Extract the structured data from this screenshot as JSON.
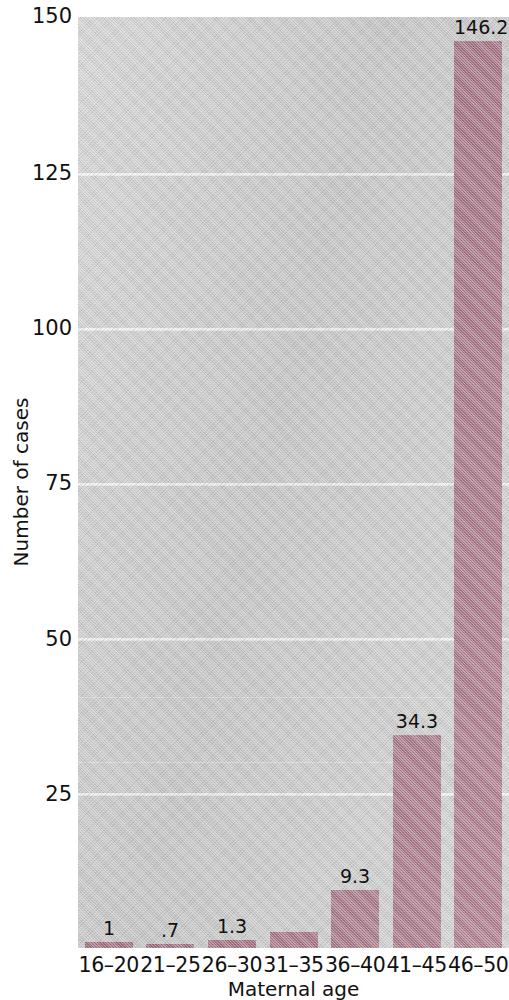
{
  "chart_data": {
    "type": "bar",
    "title": "",
    "subtitle": "",
    "xlabel": "Maternal age",
    "ylabel": "Number of cases",
    "categories": [
      "16–20",
      "21–25",
      "26–30",
      "31–35",
      "36–40",
      "41–45",
      "46–50"
    ],
    "values": [
      1,
      0.7,
      1.3,
      2.5,
      9.3,
      34.3,
      146.2
    ],
    "value_labels": [
      "1",
      ".7",
      "1.3",
      "",
      "9.3",
      "34.3",
      "146.2"
    ],
    "series": [
      {
        "name": "Number of cases",
        "values": [
          1,
          0.7,
          1.3,
          2.5,
          9.3,
          34.3,
          146.2
        ]
      }
    ],
    "ylim": [
      0,
      150
    ],
    "xlim_categories": 7,
    "yticks": [
      25,
      50,
      75,
      100,
      125,
      150
    ],
    "ytick_labels": [
      "25",
      "50",
      "75",
      "100",
      "125",
      "150"
    ],
    "grid": true,
    "grid_axis": "y",
    "grid_color": "#f4f4f4",
    "legend": false,
    "legend_position": "none",
    "bar_color": "#9d6476",
    "plot_background": "#c9c9c9",
    "figure_background": "#ffffff",
    "text_color": "#111111"
  },
  "axis": {
    "y": {
      "label": "Number of cases",
      "ticks": [
        {
          "value": 150,
          "text": "150"
        },
        {
          "value": 125,
          "text": "125"
        },
        {
          "value": 100,
          "text": "100"
        },
        {
          "value": 75,
          "text": "75"
        },
        {
          "value": 50,
          "text": "50"
        },
        {
          "value": 25,
          "text": "25"
        }
      ]
    },
    "x": {
      "label": "Maternal age",
      "ticks": [
        {
          "text": "16–20"
        },
        {
          "text": "21–25"
        },
        {
          "text": "26–30"
        },
        {
          "text": "31–35"
        },
        {
          "text": "36–40"
        },
        {
          "text": "41–45"
        },
        {
          "text": "46–50"
        }
      ]
    }
  }
}
